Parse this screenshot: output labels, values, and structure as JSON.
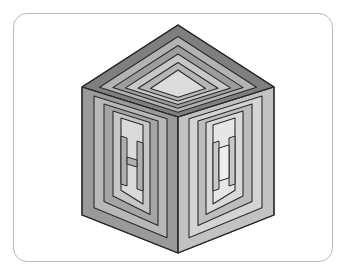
{
  "page": {
    "background_color": "#ffffff"
  },
  "card": {
    "name": "illustration-card",
    "border_color": "#b9b9b9",
    "fill_color": "#ffffff",
    "corner_radius": 14,
    "x": 13,
    "y": 13,
    "width": 320,
    "height": 249
  },
  "figure": {
    "name": "isometric-cube",
    "stroke_color": "#2b2b2b",
    "stroke_width": 1.1,
    "vertices": {
      "top": [
        178,
        25
      ],
      "left": [
        82,
        87
      ],
      "right": [
        274,
        87
      ],
      "center": [
        178,
        117
      ],
      "bottom_left": [
        82,
        215
      ],
      "bottom_right": [
        274,
        215
      ],
      "bottom": [
        178,
        253
      ]
    },
    "faces": [
      {
        "name": "top-face",
        "label": "Top",
        "ring_count": 4,
        "colors": [
          "#7f7f7f",
          "#b3b3b3",
          "#9d9d9d",
          "#c8c8c8",
          "#dcdcdc"
        ]
      },
      {
        "name": "left-face",
        "label": "Front Left",
        "ring_count": 4,
        "colors": [
          "#9a9a9a",
          "#b8b8b8",
          "#a5a5a5",
          "#c6c6c6",
          "#dadada"
        ]
      },
      {
        "name": "right-face",
        "label": "Front Right",
        "ring_count": 4,
        "colors": [
          "#c2c2c2",
          "#d4d4d4",
          "#bdbdbd",
          "#d9d9d9",
          "#e6e6e6"
        ]
      }
    ],
    "palette": {
      "top_outer": "#7f7f7f",
      "top_band2": "#b3b3b3",
      "top_band3": "#9d9d9d",
      "top_band4": "#c8c8c8",
      "top_core": "#dcdcdc",
      "left_outer": "#9a9a9a",
      "left_band2": "#b8b8b8",
      "left_band3": "#a5a5a5",
      "left_band4": "#c6c6c6",
      "left_core": "#dadada",
      "right_outer": "#c2c2c2",
      "right_band2": "#d4d4d4",
      "right_band3": "#bdbdbd",
      "right_band4": "#d9d9d9",
      "right_core": "#e6e6e6",
      "outline": "#2b2b2b"
    }
  }
}
